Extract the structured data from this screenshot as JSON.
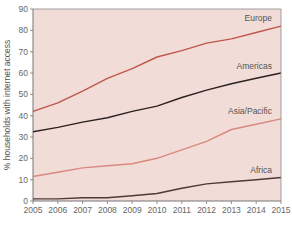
{
  "chart_data": {
    "type": "line",
    "title": "",
    "xlabel": "",
    "ylabel": "% households with internet access",
    "x": [
      2005,
      2006,
      2007,
      2008,
      2009,
      2010,
      2011,
      2012,
      2013,
      2014,
      2015
    ],
    "xlim": [
      2005,
      2015
    ],
    "ylim": [
      0,
      90
    ],
    "yticks": [
      0,
      10,
      20,
      30,
      40,
      50,
      60,
      70,
      80,
      90
    ],
    "xticks": [
      "2005",
      "2006",
      "2007",
      "2008",
      "2009",
      "2010",
      "2011",
      "2012",
      "2013",
      "2014",
      "2015"
    ],
    "grid": false,
    "legend": "inline labels near line ends",
    "series": [
      {
        "name": "Europe",
        "color": "#c0564a",
        "values": [
          42,
          46,
          51.5,
          57.5,
          62,
          67.5,
          70.5,
          74,
          76,
          79,
          82
        ]
      },
      {
        "name": "Americas",
        "color": "#2a2222",
        "values": [
          32.5,
          34.5,
          37,
          39,
          42,
          44.5,
          48.5,
          52,
          55,
          57.5,
          60
        ]
      },
      {
        "name": "Asia/Pacific",
        "color": "#d98880",
        "values": [
          11.5,
          13.5,
          15.5,
          16.5,
          17.5,
          20,
          24,
          28,
          33.5,
          36,
          38.5
        ]
      },
      {
        "name": "Africa",
        "color": "#4a3a3a",
        "values": [
          1,
          1,
          1.5,
          1.5,
          2.5,
          3.5,
          6,
          8,
          9,
          10,
          11
        ]
      }
    ]
  },
  "style": {
    "plot_background": "#f2dcd7",
    "axis_color": "#777777"
  }
}
